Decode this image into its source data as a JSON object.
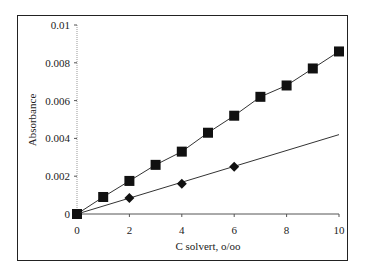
{
  "chart_data": {
    "type": "line",
    "title": "",
    "xlabel": "C solvert, o/oo",
    "ylabel": "Absorbance",
    "xlim": [
      0,
      10
    ],
    "ylim": [
      0,
      0.01
    ],
    "xticks": [
      "0",
      "2",
      "4",
      "6",
      "8",
      "10"
    ],
    "yticks": [
      "0",
      "0.002",
      "0.004",
      "0.006",
      "0.008",
      "0.01"
    ],
    "grid": false,
    "legend": null,
    "series": [
      {
        "name": "squares",
        "marker": "square",
        "x": [
          0,
          1,
          2,
          3,
          4,
          5,
          6,
          7,
          8,
          9,
          10
        ],
        "values": [
          0,
          0.0009,
          0.00175,
          0.0026,
          0.0033,
          0.0043,
          0.0052,
          0.0062,
          0.0068,
          0.0077,
          0.0086
        ]
      },
      {
        "name": "diamonds",
        "marker": "diamond",
        "x": [
          0,
          2,
          4,
          6
        ],
        "values": [
          0,
          0.00085,
          0.0016,
          0.0025
        ],
        "trendline": {
          "x": [
            0,
            10
          ],
          "values": [
            0,
            0.0042
          ]
        }
      }
    ]
  }
}
